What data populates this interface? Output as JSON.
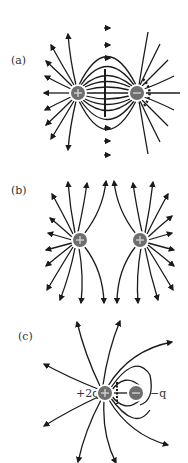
{
  "panels": [
    {
      "label": "(a)",
      "description": "Electric field lines of an electric dipole (equal and opposite charges)",
      "charges": [
        {
          "sign": "+",
          "x": 78,
          "y": 93
        },
        {
          "sign": "−",
          "x": 137,
          "y": 93
        }
      ]
    },
    {
      "label": "(b)",
      "description": "Electric field lines of two equal positive charges",
      "charges": [
        {
          "sign": "+",
          "x": 80,
          "y": 240
        },
        {
          "sign": "+",
          "x": 140,
          "y": 240
        }
      ]
    },
    {
      "label": "(c)",
      "description": "Electric field lines of charges +2q and −q",
      "charges": [
        {
          "sign": "+",
          "x": 105,
          "y": 393,
          "text": "+2q"
        },
        {
          "sign": "−",
          "x": 136,
          "y": 393,
          "text": "−q"
        }
      ]
    }
  ],
  "colors": {
    "charge_fill": "#6e6e6e",
    "line": "#1a1a1a",
    "background": "#ffffff"
  }
}
